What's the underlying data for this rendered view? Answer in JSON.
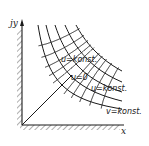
{
  "diagram": {
    "title": "",
    "type": "flow-net-corner",
    "axes": {
      "y_label": "jy",
      "x_label": "x"
    },
    "labels": [
      {
        "id": "u-konst-upper",
        "text": "u=konst."
      },
      {
        "id": "u-zero",
        "text": "u=0"
      },
      {
        "id": "u-konst-lower",
        "text": "u=konst."
      },
      {
        "id": "v-konst",
        "text": "v=konst."
      }
    ],
    "colors": {
      "line": "#1a1a1a",
      "background": "#ffffff"
    }
  }
}
